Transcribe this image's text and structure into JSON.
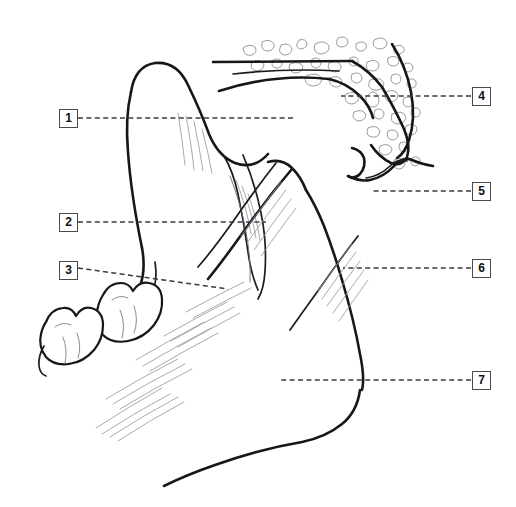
{
  "figure": {
    "background_color": "#ffffff",
    "line_color": "#17171a",
    "leader_color": "#3b3b41",
    "box_border_color": "#4a4a50",
    "stipple_color": "#95959c",
    "width": 516,
    "height": 507
  },
  "callouts": [
    {
      "id": "callout-1",
      "label": "1",
      "box_x": 59,
      "box_y": 109,
      "side": "left",
      "leader": {
        "x1": 78,
        "y1": 118,
        "x2": 296,
        "y2": 118
      }
    },
    {
      "id": "callout-2",
      "label": "2",
      "box_x": 59,
      "box_y": 213,
      "side": "left",
      "leader": {
        "x1": 78,
        "y1": 222,
        "x2": 266,
        "y2": 222
      }
    },
    {
      "id": "callout-3",
      "label": "3",
      "box_x": 59,
      "box_y": 261,
      "side": "left",
      "leader": {
        "x1": 78,
        "y1": 268,
        "x2": 228,
        "y2": 289
      }
    },
    {
      "id": "callout-4",
      "label": "4",
      "box_x": 472,
      "box_y": 87,
      "side": "right",
      "leader": {
        "x1": 471,
        "y1": 96,
        "x2": 341,
        "y2": 96
      }
    },
    {
      "id": "callout-5",
      "label": "5",
      "box_x": 472,
      "box_y": 182,
      "side": "right",
      "leader": {
        "x1": 471,
        "y1": 191,
        "x2": 371,
        "y2": 191
      }
    },
    {
      "id": "callout-6",
      "label": "6",
      "box_x": 472,
      "box_y": 259,
      "side": "right",
      "leader": {
        "x1": 471,
        "y1": 268,
        "x2": 343,
        "y2": 268
      }
    },
    {
      "id": "callout-7",
      "label": "7",
      "box_x": 472,
      "box_y": 371,
      "side": "right",
      "leader": {
        "x1": 471,
        "y1": 380,
        "x2": 280,
        "y2": 380
      }
    }
  ]
}
